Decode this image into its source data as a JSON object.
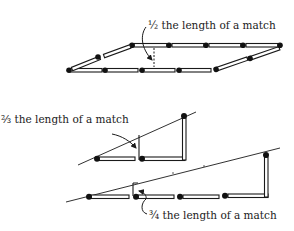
{
  "figure": {
    "colors": {
      "ink": "#1a1a1a",
      "background": "#ffffff"
    }
  },
  "labels": {
    "top": "½ the length of a match",
    "middle": "⅔ the length of a match",
    "bottom": "¾ the length of a match"
  },
  "diagrams": [
    {
      "name": "parallelogram",
      "matches": 12,
      "annotation": "½ the length of a match"
    },
    {
      "name": "small-triangle",
      "matches": 3,
      "annotation": "⅔ the length of a match"
    },
    {
      "name": "large-triangle",
      "matches": 5,
      "annotation": "¾ the length of a match"
    }
  ]
}
